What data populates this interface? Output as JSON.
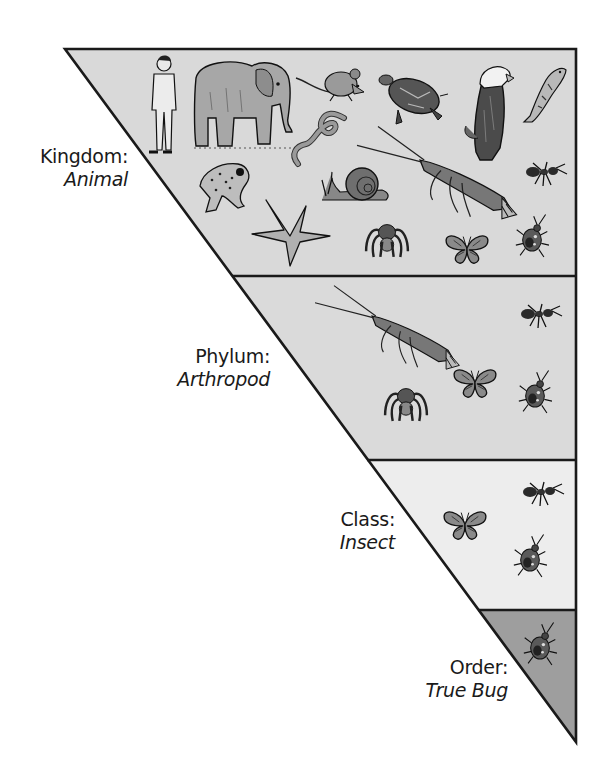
{
  "diagram": {
    "type": "taxonomic-classification-triangle",
    "colors": {
      "outline": "#1a1a1a",
      "kingdom_fill": "#d9d9d9",
      "phylum_fill": "#dadada",
      "class_fill": "#ededed",
      "order_fill": "#9e9e9e",
      "text": "#1a1a1a"
    },
    "levels": [
      {
        "rank": "Kingdom:",
        "taxon": "Animal",
        "animals": [
          "human",
          "elephant",
          "mouse",
          "turtle",
          "eagle",
          "fish",
          "earthworm",
          "frog",
          "snail",
          "lobster",
          "ant",
          "starfish",
          "spider",
          "butterfly",
          "true-bug"
        ]
      },
      {
        "rank": "Phylum:",
        "taxon": "Arthropod",
        "animals": [
          "lobster",
          "ant",
          "butterfly",
          "spider",
          "true-bug"
        ]
      },
      {
        "rank": "Class:",
        "taxon": "Insect",
        "animals": [
          "ant",
          "butterfly",
          "true-bug"
        ]
      },
      {
        "rank": "Order:",
        "taxon": "True Bug",
        "animals": [
          "true-bug"
        ]
      }
    ]
  }
}
